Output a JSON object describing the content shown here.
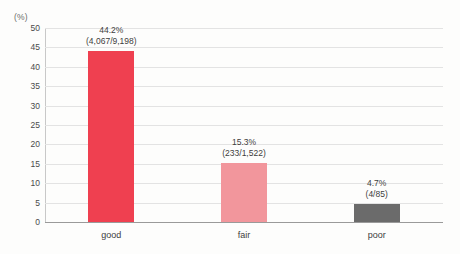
{
  "chart_data": {
    "type": "bar",
    "title": "",
    "xlabel": "",
    "ylabel": "(%)",
    "ylim": [
      0,
      50
    ],
    "ytick_step": 5,
    "yticks": [
      "0",
      "5",
      "10",
      "15",
      "20",
      "25",
      "30",
      "35",
      "40",
      "45",
      "50"
    ],
    "grid": true,
    "legend": false,
    "categories": [
      "good",
      "fair",
      "poor"
    ],
    "values": [
      44.2,
      15.3,
      4.7
    ],
    "series": [
      {
        "name": "percentage",
        "values": [
          44.2,
          15.3,
          4.7
        ]
      }
    ],
    "annotations": [
      {
        "category": "good",
        "percent_label": "44.2%",
        "fraction_label": "(4,067/9,198)",
        "numerator": 4067,
        "denominator": 9198,
        "color": "#ef4050"
      },
      {
        "category": "fair",
        "percent_label": "15.3%",
        "fraction_label": "(233/1,522)",
        "numerator": 233,
        "denominator": 1522,
        "color": "#f2969c"
      },
      {
        "category": "poor",
        "percent_label": "4.7%",
        "fraction_label": "(4/85)",
        "numerator": 4,
        "denominator": 85,
        "color": "#6b6b6b"
      }
    ],
    "colors": {
      "bar_good": "#ef4050",
      "bar_fair": "#f2969c",
      "bar_poor": "#6b6b6b",
      "gridline": "#e3e3e3",
      "baseline": "#9a9a9a",
      "text": "#3d3d3d",
      "background": "#fdfdfc"
    }
  }
}
